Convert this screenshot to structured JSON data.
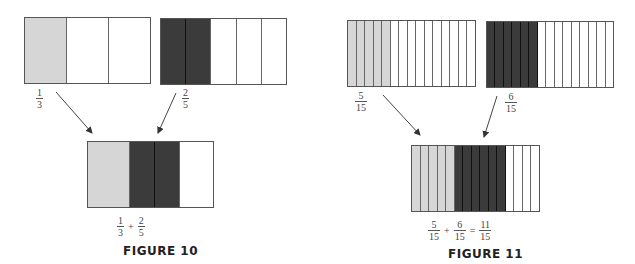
{
  "colors": {
    "light": "#d6d6d6",
    "dark": "#3b3b3b",
    "empty": "#ffffff",
    "line": "#555555"
  },
  "figure10": {
    "caption": "FIGURE 10",
    "bar_a": {
      "cells": [
        "light",
        "empty",
        "empty"
      ],
      "label": {
        "num": "1",
        "den": "3"
      }
    },
    "bar_b": {
      "cells": [
        "dark",
        "dark",
        "empty",
        "empty",
        "empty"
      ],
      "label": {
        "num": "2",
        "den": "5"
      }
    },
    "combined": {
      "segments": [
        {
          "fill": "light",
          "width_frac": "1/3"
        },
        {
          "fill": "dark",
          "width_frac": "1/5"
        },
        {
          "fill": "dark",
          "width_frac": "1/5"
        },
        {
          "fill": "empty",
          "width_frac": "4/15"
        }
      ],
      "expression": {
        "left": {
          "num": "1",
          "den": "3"
        },
        "op": "+",
        "right": {
          "num": "2",
          "den": "5"
        }
      }
    }
  },
  "figure11": {
    "caption": "FIGURE 11",
    "bar_a": {
      "cells": [
        "light",
        "light",
        "light",
        "light",
        "light",
        "empty",
        "empty",
        "empty",
        "empty",
        "empty",
        "empty",
        "empty",
        "empty",
        "empty",
        "empty"
      ],
      "label": {
        "num": "5",
        "den": "15"
      }
    },
    "bar_b": {
      "cells": [
        "dark",
        "dark",
        "dark",
        "dark",
        "dark",
        "dark",
        "empty",
        "empty",
        "empty",
        "empty",
        "empty",
        "empty",
        "empty",
        "empty",
        "empty"
      ],
      "label": {
        "num": "6",
        "den": "15"
      }
    },
    "combined": {
      "cells": [
        "light",
        "light",
        "light",
        "light",
        "light",
        "dark",
        "dark",
        "dark",
        "dark",
        "dark",
        "dark",
        "empty",
        "empty",
        "empty",
        "empty"
      ],
      "expression": {
        "a": {
          "num": "5",
          "den": "15"
        },
        "op1": "+",
        "b": {
          "num": "6",
          "den": "15"
        },
        "op2": "=",
        "c": {
          "num": "11",
          "den": "15"
        }
      }
    }
  }
}
